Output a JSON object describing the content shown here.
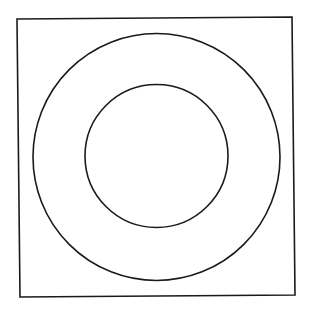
{
  "diagram": {
    "colors": {
      "background": "#ffffff",
      "stroke": "#1a1a1a"
    },
    "square": {
      "points": "17,19 292,17 295,295 20,297"
    },
    "outer_circle": {
      "cx": 156.5,
      "cy": 157,
      "r": 123.5
    },
    "inner_circle": {
      "cx": 156.5,
      "cy": 156,
      "r": 71.5
    }
  }
}
